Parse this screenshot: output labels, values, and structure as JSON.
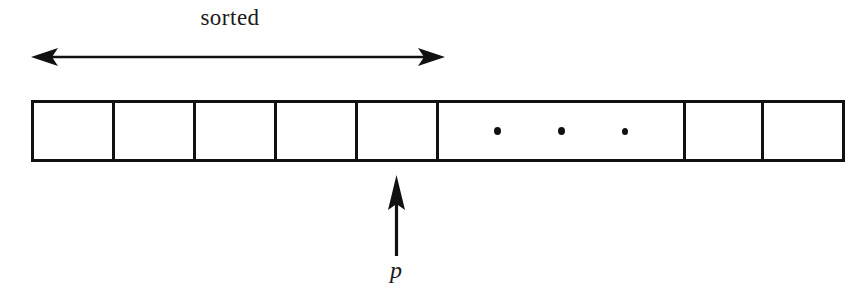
{
  "figure": {
    "type": "array-diagram",
    "background_color": "#ffffff",
    "ink_color": "#111111"
  },
  "span_annotation": {
    "label": "sorted",
    "icon": "double-headed-horizontal-arrow",
    "x_start": 33,
    "x_end": 438,
    "y": 57,
    "covers_cells": 5
  },
  "array": {
    "x": 31,
    "y": 100,
    "height": 62,
    "border_width": 3,
    "cells": [
      {
        "index": 0,
        "width": 81,
        "content": "",
        "kind": "empty"
      },
      {
        "index": 1,
        "width": 81,
        "content": "",
        "kind": "empty"
      },
      {
        "index": 2,
        "width": 81,
        "content": "",
        "kind": "empty"
      },
      {
        "index": 3,
        "width": 81,
        "content": "",
        "kind": "empty"
      },
      {
        "index": 4,
        "width": 81,
        "content": "",
        "kind": "empty"
      },
      {
        "index": 5,
        "width": 247,
        "content": "• • •",
        "kind": "ellipsis",
        "dots": 3
      },
      {
        "index": 6,
        "width": 78,
        "content": "",
        "kind": "empty"
      },
      {
        "index": 7,
        "width": 78,
        "content": "",
        "kind": "empty"
      }
    ]
  },
  "pointer": {
    "label": "p",
    "icon": "up-arrow",
    "x": 396,
    "tip_y": 177,
    "tail_y": 255,
    "points_to_cell": 4
  }
}
